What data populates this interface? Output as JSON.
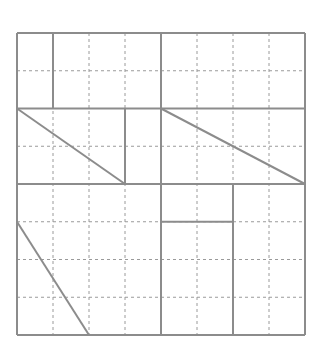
{
  "diagram": {
    "type": "grid-figure",
    "grid": {
      "columns": 8,
      "rows": 8,
      "origin_x": 17,
      "origin_y": 33,
      "cell_width": 36,
      "cell_height": 37.75
    },
    "colors": {
      "line": "#8c8c8c",
      "dashed": "#9a9a9a",
      "background": "#ffffff"
    },
    "panels": [
      {
        "name": "top-panel",
        "description": "Top 2 rows: rectangles divided at column 1 and column 4",
        "solid_segments": [
          {
            "from": [
              1,
              0
            ],
            "to": [
              1,
              2
            ]
          },
          {
            "from": [
              4,
              0
            ],
            "to": [
              4,
              2
            ]
          }
        ]
      },
      {
        "name": "middle-panel",
        "description": "Rows 2-4: two right triangles",
        "solid_segments": [
          {
            "from": [
              3,
              2
            ],
            "to": [
              3,
              4
            ]
          },
          {
            "from": [
              4,
              2
            ],
            "to": [
              4,
              4
            ]
          }
        ],
        "diagonals": [
          {
            "from": [
              0,
              2
            ],
            "to": [
              3,
              4
            ]
          },
          {
            "from": [
              4,
              2
            ],
            "to": [
              8,
              4
            ]
          }
        ]
      },
      {
        "name": "bottom-panel",
        "description": "Rows 4-8: triangle on left, rectangle split on right",
        "solid_segments": [
          {
            "from": [
              4,
              4
            ],
            "to": [
              4,
              8
            ]
          },
          {
            "from": [
              6,
              4
            ],
            "to": [
              6,
              8
            ]
          },
          {
            "from": [
              4,
              5
            ],
            "to": [
              6,
              5
            ]
          }
        ],
        "diagonals": [
          {
            "from": [
              0,
              5
            ],
            "to": [
              2,
              8
            ]
          }
        ]
      }
    ],
    "outer_solid_horizontals": [
      0,
      2,
      4,
      8
    ],
    "outer_solid_verticals": [
      0,
      8
    ]
  }
}
